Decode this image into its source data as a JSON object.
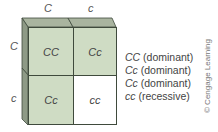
{
  "punnett": {
    "column_headers": [
      "C",
      "c"
    ],
    "row_headers": [
      "C",
      "c"
    ],
    "cells": [
      [
        "CC",
        "Cc"
      ],
      [
        "Cc",
        "cc"
      ]
    ],
    "colors": {
      "dominant_fill": "#cfdcc4",
      "recessive_fill": "#ffffff",
      "top_face": "#a9b49f",
      "side_face": "#8e9a86",
      "border": "#3f4a3c"
    }
  },
  "legend": [
    {
      "genotype": "CC",
      "label": "(dominant)"
    },
    {
      "genotype": "Cc",
      "label": "(dominant)"
    },
    {
      "genotype": "Cc",
      "label": "(dominant)"
    },
    {
      "genotype": "cc",
      "label": "(recessive)"
    }
  ],
  "credit": "© Cengage Learning"
}
